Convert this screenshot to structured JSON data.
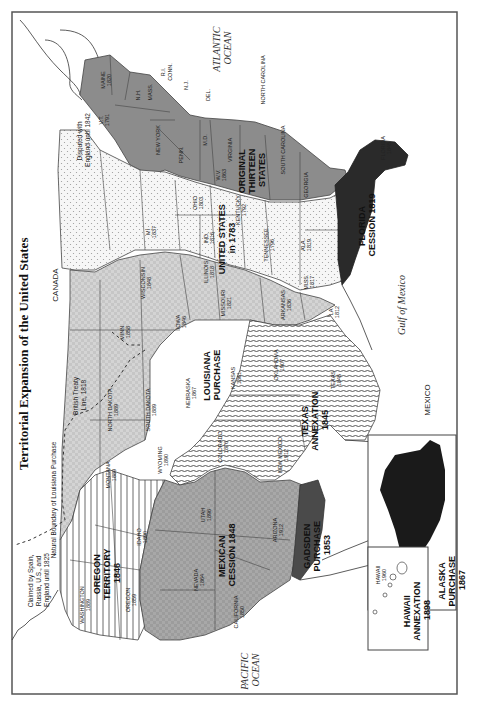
{
  "title": "Territorial Expansion of the United States",
  "orientation": "rotated 90 degrees clockwise (north at left)",
  "water_labels": {
    "atlantic": [
      "ATLANTIC",
      "OCEAN"
    ],
    "pacific": [
      "PACIFIC",
      "OCEAN"
    ],
    "gulf": "Gulf of Mexico"
  },
  "country_labels": {
    "canada": "CANADA",
    "mexico": "MEXICO"
  },
  "notes": {
    "disputed": [
      "Disputed with",
      "England until 1842"
    ],
    "british_treaty": [
      "British Treaty",
      "Line, 1818"
    ],
    "natural_boundary": "Natural Boundary of Louisiana Purchase",
    "claimed": [
      "Claimed by Spain,",
      "Russia, U.S., and",
      "England until 1825"
    ]
  },
  "regions": [
    {
      "id": "original-thirteen",
      "label": [
        "ORIGINAL",
        "THIRTEEN",
        "STATES"
      ],
      "fill": "#8c8c8c"
    },
    {
      "id": "us-1783",
      "label": [
        "UNITED STATES",
        "in 1783"
      ],
      "fill": "#f0f0f0"
    },
    {
      "id": "louisiana-purchase",
      "label": [
        "LOUISIANA",
        "PURCHASE"
      ],
      "fill": "#cfcfcf"
    },
    {
      "id": "florida-cession",
      "label": [
        "FLORIDA",
        "CESSION 1819"
      ],
      "fill": "#2a2a2a"
    },
    {
      "id": "texas-annexation",
      "label": [
        "TEXAS",
        "ANNEXATION",
        "1845"
      ],
      "fill": "striped"
    },
    {
      "id": "oregon-territory",
      "label": [
        "OREGON",
        "TERRITORY",
        "1846"
      ],
      "fill": "striped-vertical"
    },
    {
      "id": "mexican-cession",
      "label": [
        "MEXICAN",
        "CESSION 1848"
      ],
      "fill": "#a6a6a6"
    },
    {
      "id": "gadsden-purchase",
      "label": [
        "GADSDEN",
        "PURCHASE",
        "1853"
      ],
      "fill": "#4a4a4a"
    },
    {
      "id": "alaska-purchase",
      "label": [
        "ALASKA",
        "PURCHASE",
        "1867"
      ],
      "fill": "#1a1a1a"
    },
    {
      "id": "hawaii-annexation",
      "label": [
        "HAWAII",
        "ANNEXATION",
        "1898"
      ],
      "fill": "#ffffff"
    }
  ],
  "states": [
    {
      "name": "MAINE",
      "year": "1820"
    },
    {
      "name": "N.H.",
      "year": ""
    },
    {
      "name": "MASS.",
      "year": ""
    },
    {
      "name": "R.I.",
      "year": ""
    },
    {
      "name": "CONN.",
      "year": ""
    },
    {
      "name": "N.J.",
      "year": ""
    },
    {
      "name": "DEL.",
      "year": ""
    },
    {
      "name": "V.T.",
      "year": "1791"
    },
    {
      "name": "NEW YORK",
      "year": ""
    },
    {
      "name": "PENN.",
      "year": ""
    },
    {
      "name": "M.D.",
      "year": ""
    },
    {
      "name": "VIRGINIA",
      "year": ""
    },
    {
      "name": "NORTH CAROLINA",
      "year": ""
    },
    {
      "name": "SOUTH CAROLINA",
      "year": ""
    },
    {
      "name": "GEORGIA",
      "year": ""
    },
    {
      "name": "W.V.",
      "year": "1863"
    },
    {
      "name": "OHIO",
      "year": "1803"
    },
    {
      "name": "KENTUCKY",
      "year": "1792"
    },
    {
      "name": "TENNESSEE",
      "year": "1796"
    },
    {
      "name": "IND.",
      "year": "1816"
    },
    {
      "name": "ILLINOIS",
      "year": "1818"
    },
    {
      "name": "MI",
      "year": "1837"
    },
    {
      "name": "WISCONSIN",
      "year": "1848"
    },
    {
      "name": "ALA.",
      "year": "1819"
    },
    {
      "name": "MISS.",
      "year": "1817"
    },
    {
      "name": "FLORIDA",
      "year": "1845"
    },
    {
      "name": "MINN.",
      "year": "1858"
    },
    {
      "name": "IOWA",
      "year": "1846"
    },
    {
      "name": "MISSOURI",
      "year": "1821"
    },
    {
      "name": "ARKANSAS",
      "year": "1836"
    },
    {
      "name": "LA",
      "year": "1812"
    },
    {
      "name": "NORTH DAKOTA",
      "year": "1889"
    },
    {
      "name": "SOUTH DAKOTA",
      "year": "1889"
    },
    {
      "name": "NEBRASKA",
      "year": "1867"
    },
    {
      "name": "KANSAS",
      "year": "1861"
    },
    {
      "name": "OKLAHOMA",
      "year": "1907"
    },
    {
      "name": "TEXAS",
      "year": "1845"
    },
    {
      "name": "MONTANA",
      "year": "1889"
    },
    {
      "name": "WYOMING",
      "year": "1890"
    },
    {
      "name": "COLORADO",
      "year": "1876"
    },
    {
      "name": "NEW MEXICO",
      "year": "1912"
    },
    {
      "name": "WASHINGTON",
      "year": "1889"
    },
    {
      "name": "OREGON",
      "year": "1859"
    },
    {
      "name": "IDAHO",
      "year": "1890"
    },
    {
      "name": "UTAH",
      "year": "1896"
    },
    {
      "name": "NEVADA",
      "year": "1864"
    },
    {
      "name": "ARIZONA",
      "year": "1912"
    },
    {
      "name": "CALIFORNIA",
      "year": "1850"
    },
    {
      "name": "HAWAII",
      "year": "1960"
    },
    {
      "name": "ALASKA",
      "year": "1959"
    }
  ]
}
